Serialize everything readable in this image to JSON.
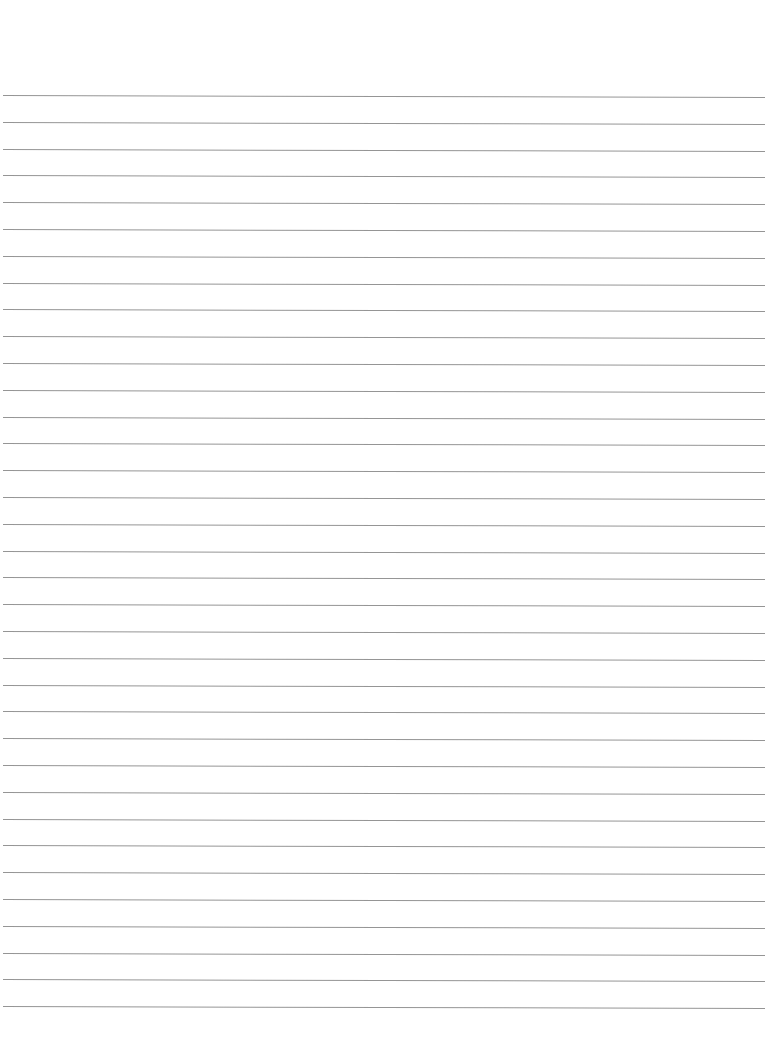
{
  "page": {
    "type": "lined-paper",
    "background_color": "#ffffff",
    "rule_color": "#8a8a8a",
    "rule_count": 35,
    "first_rule_y": 95,
    "rule_spacing": 26.8,
    "rule_left": 3,
    "rule_width": 762,
    "content": []
  }
}
